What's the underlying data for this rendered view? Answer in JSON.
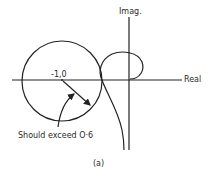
{
  "diagram": {
    "type": "nyquist-plot",
    "axes": {
      "real_label": "Real",
      "imag_label": "Imag."
    },
    "critical_point_label": "-1,0",
    "annotation": "Should exceed O·6",
    "caption": "(a)",
    "colors": {
      "ink": "#222222",
      "background": "#ffffff"
    }
  }
}
